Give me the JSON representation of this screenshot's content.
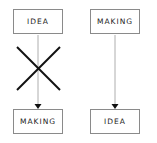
{
  "diagram": {
    "left_flow": {
      "top_label": "IDEA",
      "bottom_label": "MAKING",
      "crossed_out": true,
      "cross_icon": "x-mark"
    },
    "right_flow": {
      "top_label": "MAKING",
      "bottom_label": "IDEA",
      "crossed_out": false
    },
    "colors": {
      "box_border": "#8a8a8a",
      "connector": "#999999",
      "arrowhead": "#111111",
      "cross": "#111111",
      "text": "#222222"
    }
  }
}
